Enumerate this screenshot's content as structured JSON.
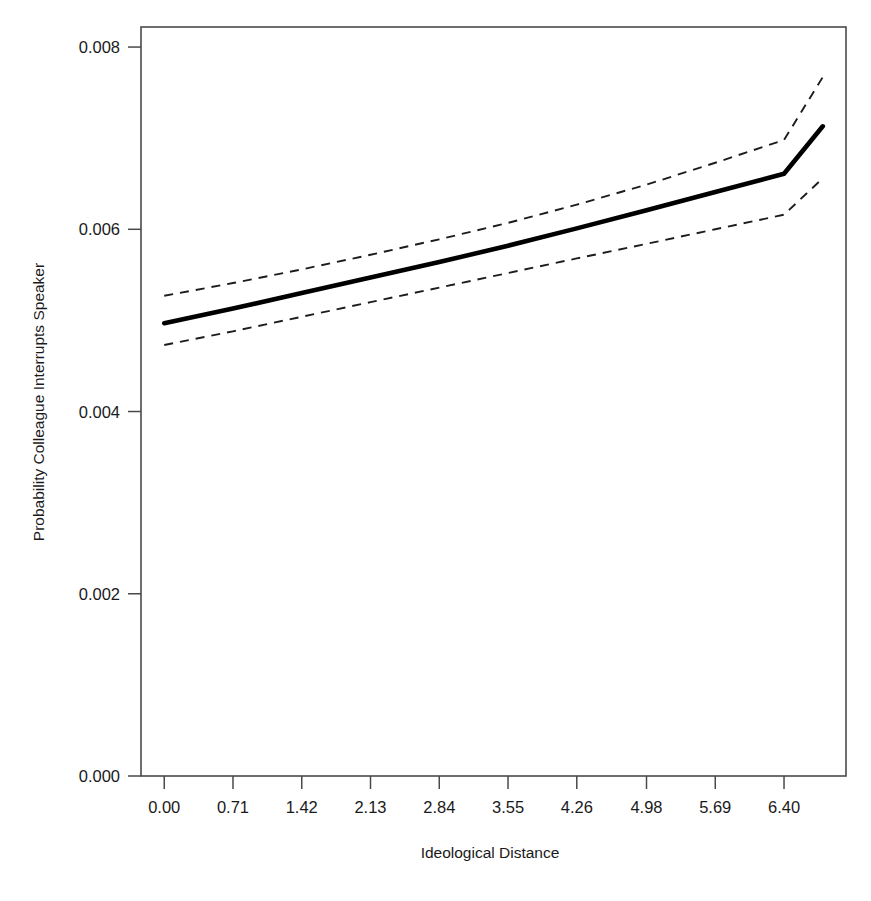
{
  "chart_data": {
    "type": "line",
    "title": "",
    "xlabel": "Ideological Distance",
    "ylabel": "Probability Colleague Interrupts Speaker",
    "xlim": [
      -0.24,
      7.04
    ],
    "ylim": [
      0.0,
      0.00822
    ],
    "xticks": [
      0.0,
      0.71,
      1.42,
      2.13,
      2.84,
      3.55,
      4.26,
      4.98,
      5.69,
      6.4
    ],
    "xtick_labels": [
      "0.00",
      "0.71",
      "1.42",
      "2.13",
      "2.84",
      "3.55",
      "4.26",
      "4.98",
      "5.69",
      "6.40"
    ],
    "yticks": [
      0.0,
      0.002,
      0.004,
      0.006,
      0.008
    ],
    "ytick_labels": [
      "0.000",
      "0.002",
      "0.004",
      "0.006",
      "0.008"
    ],
    "grid": false,
    "legend": "none",
    "box": true,
    "series": [
      {
        "name": "Predicted probability",
        "style": "solid",
        "x": [
          0.0,
          0.71,
          1.42,
          2.13,
          2.84,
          3.55,
          4.26,
          4.98,
          5.69,
          6.4,
          6.8
        ],
        "values": [
          0.00497,
          0.00513,
          0.0053,
          0.00547,
          0.00564,
          0.00582,
          0.00601,
          0.00621,
          0.00641,
          0.00661,
          0.00713
        ]
      },
      {
        "name": "Upper 95% confidence bound",
        "style": "dashed",
        "x": [
          0.0,
          0.71,
          1.42,
          2.13,
          2.84,
          3.55,
          4.26,
          4.98,
          5.69,
          6.4,
          6.8
        ],
        "values": [
          0.00527,
          0.00541,
          0.00556,
          0.00572,
          0.00589,
          0.00607,
          0.00627,
          0.00649,
          0.00673,
          0.00698,
          0.00767
        ]
      },
      {
        "name": "Lower 95% confidence bound",
        "style": "dashed",
        "x": [
          0.0,
          0.71,
          1.42,
          2.13,
          2.84,
          3.55,
          4.26,
          4.98,
          5.69,
          6.4,
          6.8
        ],
        "values": [
          0.00473,
          0.00488,
          0.00504,
          0.0052,
          0.00536,
          0.00552,
          0.00568,
          0.00584,
          0.006,
          0.00616,
          0.00656
        ]
      }
    ]
  }
}
